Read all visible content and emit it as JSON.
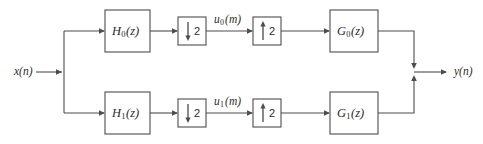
{
  "diagram": {
    "type": "two-channel-filter-bank-block-diagram",
    "background_color": "#ffffff",
    "line_color": "#4d4d4d",
    "text_color": "#2b2b2b",
    "input": {
      "label_main": "x",
      "label_paren": "(n)"
    },
    "output": {
      "label_main": "y",
      "label_paren": "(n)"
    },
    "branches": [
      {
        "id": "upper",
        "analysis_filter": {
          "main": "H",
          "sub": "0",
          "arg": "(z)"
        },
        "downsampler": {
          "factor": "2",
          "direction": "down"
        },
        "signal": {
          "main": "u",
          "sub": "0",
          "arg": "(m)"
        },
        "upsampler": {
          "factor": "2",
          "direction": "up"
        },
        "synthesis_filter": {
          "main": "G",
          "sub": "0",
          "arg": "(z)"
        }
      },
      {
        "id": "lower",
        "analysis_filter": {
          "main": "H",
          "sub": "1",
          "arg": "(z)"
        },
        "downsampler": {
          "factor": "2",
          "direction": "down"
        },
        "signal": {
          "main": "u",
          "sub": "1",
          "arg": "(m)"
        },
        "upsampler": {
          "factor": "2",
          "direction": "up"
        },
        "synthesis_filter": {
          "main": "G",
          "sub": "1",
          "arg": "(z)"
        }
      }
    ]
  }
}
